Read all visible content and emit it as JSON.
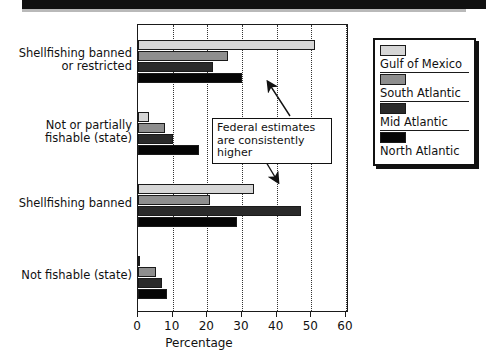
{
  "chart_data": {
    "type": "bar",
    "orientation": "horizontal",
    "title": "",
    "xlabel": "Percentage",
    "ylabel": "",
    "xlim": [
      0,
      60
    ],
    "xticks": [
      0,
      10,
      20,
      30,
      40,
      50,
      60
    ],
    "grid": "vertical-dotted",
    "legend_position": "right",
    "categories": [
      "Shellfishing banned\nor restricted",
      "Not or partially\nfishable (state)",
      "Shellfishing banned",
      "Not fishable (state)"
    ],
    "series": [
      {
        "name": "Gulf of Mexico",
        "color": "#d6d6d6",
        "values": [
          51,
          3.2,
          33.5,
          0.4
        ]
      },
      {
        "name": "South Atlantic",
        "color": "#8e8e8e",
        "values": [
          26,
          7.8,
          20.7,
          5.2
        ]
      },
      {
        "name": "Mid Atlantic",
        "color": "#2a2a2a",
        "values": [
          21.5,
          10.1,
          47,
          7.0
        ]
      },
      {
        "name": "North Atlantic",
        "color": "#050505",
        "values": [
          30,
          17.5,
          28.5,
          8.3
        ]
      }
    ],
    "annotations": [
      {
        "text": "Federal estimates\nare consistently higher",
        "points_to": [
          "Shellfishing banned or restricted",
          "Shellfishing banned"
        ]
      }
    ]
  },
  "axis": {
    "tick_labels": [
      "0",
      "10",
      "20",
      "30",
      "40",
      "50",
      "60"
    ],
    "title": "Percentage"
  },
  "categories": [
    {
      "label": "Shellfishing banned\nor restricted"
    },
    {
      "label": "Not or partially\nfishable (state)"
    },
    {
      "label": "Shellfishing banned"
    },
    {
      "label": "Not fishable (state)"
    }
  ],
  "legend": {
    "items": [
      {
        "label": "Gulf of Mexico",
        "swatch": "light-gray"
      },
      {
        "label": "South Atlantic",
        "swatch": "medium-gray"
      },
      {
        "label": "Mid Atlantic",
        "swatch": "dark-gray"
      },
      {
        "label": "North Atlantic",
        "swatch": "black"
      }
    ]
  },
  "callout": {
    "text": "Federal estimates\nare consistently higher"
  },
  "colors": {
    "series_1": "#d6d6d6",
    "series_2": "#8e8e8e",
    "series_3": "#2a2a2a",
    "series_4": "#050505",
    "axis": "#1a1a1a",
    "banner": "#111111"
  }
}
